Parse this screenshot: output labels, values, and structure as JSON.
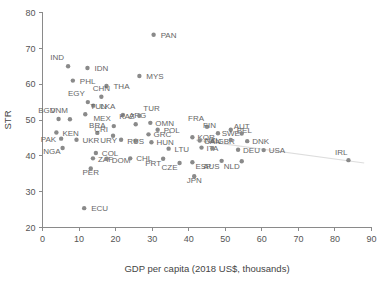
{
  "chart_data": {
    "type": "scatter",
    "title": "",
    "xlabel": "GDP per capita (2018 US$, thousands)",
    "ylabel": "STR",
    "xlim": [
      0,
      90
    ],
    "ylim": [
      20,
      80
    ],
    "xticks": [
      0,
      10,
      20,
      30,
      40,
      50,
      60,
      70,
      80,
      90
    ],
    "yticks": [
      20,
      30,
      40,
      50,
      60,
      70,
      80
    ],
    "grid": false,
    "legend": "none",
    "point_color": "#8a8a8a",
    "label_color": "#666666",
    "axis_color": "#8a8a8a",
    "trendline": {
      "present": true,
      "color": "#dddddd",
      "x0": 42.0,
      "y0": 44.4,
      "x1": 88.0,
      "y1": 38.0
    },
    "points": [
      {
        "label": "PAN",
        "x": 30.4,
        "y": 73.8,
        "lx": 7,
        "ly": 3
      },
      {
        "label": "IND",
        "x": 7.0,
        "y": 65.0,
        "lx": -4,
        "ly": -6
      },
      {
        "label": "IDN",
        "x": 12.3,
        "y": 64.5,
        "lx": 7,
        "ly": 3
      },
      {
        "label": "MYS",
        "x": 26.5,
        "y": 62.3,
        "lx": 7,
        "ly": 3
      },
      {
        "label": "PHL",
        "x": 8.3,
        "y": 61.0,
        "lx": 7,
        "ly": 3
      },
      {
        "label": "THA",
        "x": 17.5,
        "y": 59.5,
        "lx": 7,
        "ly": 3
      },
      {
        "label": "CHN",
        "x": 16.1,
        "y": 56.5,
        "lx": 0,
        "ly": -6
      },
      {
        "label": "EGY",
        "x": 12.4,
        "y": 55.0,
        "lx": -3,
        "ly": -6
      },
      {
        "label": "LKA",
        "x": 13.9,
        "y": 54.0,
        "lx": 7,
        "ly": 3
      },
      {
        "label": "TUN",
        "x": 11.7,
        "y": 51.6,
        "lx": 5,
        "ly": -5
      },
      {
        "label": "BGD",
        "x": 4.4,
        "y": 50.3,
        "lx": -3,
        "ly": -6
      },
      {
        "label": "VNM",
        "x": 7.5,
        "y": 50.2,
        "lx": -2,
        "ly": -6
      },
      {
        "label": "ARG",
        "x": 22.0,
        "y": 51.4,
        "lx": 6,
        "ly": 3
      },
      {
        "label": "TUR",
        "x": 26.5,
        "y": 51.2,
        "lx": 4,
        "ly": -5
      },
      {
        "label": "KAZ",
        "x": 25.5,
        "y": 48.8,
        "lx": -1,
        "ly": -5
      },
      {
        "label": "MEX",
        "x": 19.5,
        "y": 48.3,
        "lx": -3,
        "ly": -5
      },
      {
        "label": "OMN",
        "x": 29.5,
        "y": 49.2,
        "lx": 5,
        "ly": 3
      },
      {
        "label": "POL",
        "x": 31.5,
        "y": 47.3,
        "lx": 6,
        "ly": 3
      },
      {
        "label": "KEN",
        "x": 3.8,
        "y": 46.5,
        "lx": 6,
        "ly": 3
      },
      {
        "label": "BRA",
        "x": 15.0,
        "y": 46.4,
        "lx": 0,
        "ly": -5
      },
      {
        "label": "GRC",
        "x": 29.0,
        "y": 46.0,
        "lx": 5,
        "ly": 3
      },
      {
        "label": "CRI",
        "x": 19.3,
        "y": 45.6,
        "lx": -5,
        "ly": -4
      },
      {
        "label": "PAK",
        "x": 5.1,
        "y": 44.8,
        "lx": -5,
        "ly": 3
      },
      {
        "label": "UKR",
        "x": 9.3,
        "y": 44.5,
        "lx": 6,
        "ly": 3
      },
      {
        "label": "URY",
        "x": 21.5,
        "y": 44.5,
        "lx": -4,
        "ly": 3
      },
      {
        "label": "RUS",
        "x": 25.5,
        "y": 44.2,
        "lx": 0,
        "ly": 3
      },
      {
        "label": "HUN",
        "x": 29.8,
        "y": 43.8,
        "lx": 5,
        "ly": 3
      },
      {
        "label": "KOR",
        "x": 41.0,
        "y": 45.2,
        "lx": 5,
        "ly": 3
      },
      {
        "label": "FRA",
        "x": 45.0,
        "y": 48.1,
        "lx": -3,
        "ly": -6
      },
      {
        "label": "BEL",
        "x": 51.5,
        "y": 47.3,
        "lx": 6,
        "ly": 3
      },
      {
        "label": "FIN",
        "x": 48.0,
        "y": 46.3,
        "lx": -2,
        "ly": -5
      },
      {
        "label": "AUT",
        "x": 54.5,
        "y": 46.2,
        "lx": 0,
        "ly": -5
      },
      {
        "label": "NZL",
        "x": 43.0,
        "y": 44.3,
        "lx": 5,
        "ly": 3
      },
      {
        "label": "GBR",
        "x": 46.5,
        "y": 44.1,
        "lx": 5,
        "ly": 3
      },
      {
        "label": "SWE",
        "x": 51.5,
        "y": 44.4,
        "lx": 0,
        "ly": -4
      },
      {
        "label": "DNK",
        "x": 56.0,
        "y": 44.1,
        "lx": 5,
        "ly": 3
      },
      {
        "label": "NGA",
        "x": 5.5,
        "y": 42.2,
        "lx": -2,
        "ly": 6
      },
      {
        "label": "LTU",
        "x": 34.5,
        "y": 42.0,
        "lx": 6,
        "ly": 3
      },
      {
        "label": "ITA",
        "x": 43.5,
        "y": 42.3,
        "lx": 5,
        "ly": 3
      },
      {
        "label": "CAN",
        "x": 46.5,
        "y": 42.1,
        "lx": 0,
        "ly": -4
      },
      {
        "label": "DEU",
        "x": 53.5,
        "y": 41.7,
        "lx": 5,
        "ly": 3
      },
      {
        "label": "USA",
        "x": 60.5,
        "y": 41.6,
        "lx": 5,
        "ly": 3
      },
      {
        "label": "COL",
        "x": 14.6,
        "y": 40.8,
        "lx": 6,
        "ly": 3
      },
      {
        "label": "ZAF",
        "x": 13.8,
        "y": 39.3,
        "lx": 5,
        "ly": 4
      },
      {
        "label": "DOM",
        "x": 17.6,
        "y": 39.2,
        "lx": 5,
        "ly": 4
      },
      {
        "label": "CHL",
        "x": 24.0,
        "y": 39.3,
        "lx": 6,
        "ly": 3
      },
      {
        "label": "PRT",
        "x": 33.0,
        "y": 39.2,
        "lx": -2,
        "ly": 7
      },
      {
        "label": "CZE",
        "x": 37.5,
        "y": 38.0,
        "lx": -2,
        "ly": 7
      },
      {
        "label": "ESP",
        "x": 41.0,
        "y": 38.2,
        "lx": 3,
        "ly": 7
      },
      {
        "label": "AUS",
        "x": 49.0,
        "y": 38.6,
        "lx": -2,
        "ly": 8
      },
      {
        "label": "NLD",
        "x": 54.5,
        "y": 38.5,
        "lx": -2,
        "ly": 8
      },
      {
        "label": "IRL",
        "x": 83.7,
        "y": 38.8,
        "lx": -1,
        "ly": -5
      },
      {
        "label": "JPN",
        "x": 41.5,
        "y": 34.3,
        "lx": 0,
        "ly": 7
      },
      {
        "label": "PER",
        "x": 13.2,
        "y": 36.5,
        "lx": 0,
        "ly": 7
      },
      {
        "label": "ECU",
        "x": 11.4,
        "y": 25.4,
        "lx": 7,
        "ly": 3
      }
    ]
  }
}
